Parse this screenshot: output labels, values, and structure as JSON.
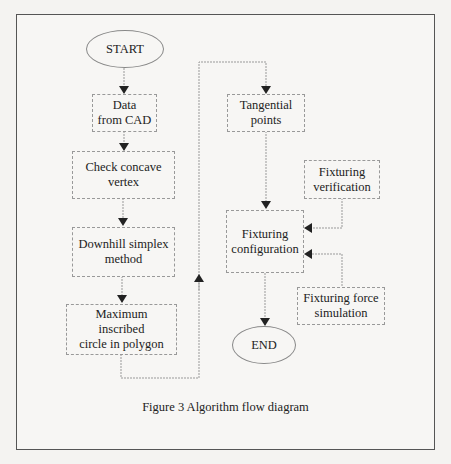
{
  "figure": {
    "caption": "Figure 3  Algorithm flow diagram"
  },
  "nodes": {
    "start": "START",
    "data_from_cad": "Data\nfrom CAD",
    "check_concave": "Check concave\nvertex",
    "downhill_simplex": "Downhill simplex\nmethod",
    "max_inscribed": "Maximum inscribed\ncircle in polygon",
    "tangential_points": "Tangential\npoints",
    "fixturing_verification": "Fixturing\nverification",
    "fixturing_configuration": "Fixturing\nconfiguration",
    "fixturing_force_simulation": "Fixturing force\nsimulation",
    "end": "END"
  },
  "edges": [
    {
      "from": "START",
      "to": "Data from CAD"
    },
    {
      "from": "Data from CAD",
      "to": "Check concave vertex"
    },
    {
      "from": "Check concave vertex",
      "to": "Downhill simplex method"
    },
    {
      "from": "Downhill simplex method",
      "to": "Maximum inscribed circle in polygon"
    },
    {
      "from": "Maximum inscribed circle in polygon",
      "to": "Tangential points"
    },
    {
      "from": "Tangential points",
      "to": "Fixturing configuration"
    },
    {
      "from": "Fixturing verification",
      "to": "Fixturing configuration"
    },
    {
      "from": "Fixturing force simulation",
      "to": "Fixturing configuration"
    },
    {
      "from": "Fixturing configuration",
      "to": "END"
    }
  ],
  "colors": {
    "background": "#f4f3f1",
    "frame": "#555555",
    "lines": "#999999",
    "arrows": "#222222"
  }
}
